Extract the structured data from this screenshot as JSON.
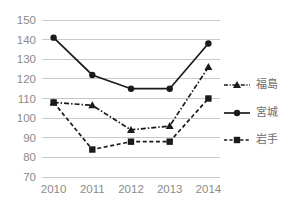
{
  "chart_data": {
    "type": "line",
    "title": "",
    "xlabel": "",
    "ylabel": "",
    "categories": [
      "2010",
      "2011",
      "2012",
      "2013",
      "2014"
    ],
    "x": [
      2010,
      2011,
      2012,
      2013,
      2014
    ],
    "ylim": [
      70,
      150
    ],
    "y_ticks": [
      70,
      80,
      90,
      100,
      110,
      120,
      130,
      140,
      150
    ],
    "grid": true,
    "legend_position": "right",
    "series": [
      {
        "name": "福島",
        "marker": "triangle",
        "line_style": "dash-dot",
        "color": "#1a1a1a",
        "values": [
          108,
          106.5,
          94,
          96,
          126
        ]
      },
      {
        "name": "宮城",
        "marker": "circle",
        "line_style": "solid",
        "color": "#1a1a1a",
        "values": [
          141,
          122,
          115,
          115,
          138
        ]
      },
      {
        "name": "岩手",
        "marker": "square",
        "line_style": "dashed",
        "color": "#1a1a1a",
        "values": [
          108,
          84,
          88,
          88,
          110
        ]
      }
    ]
  },
  "axis": {
    "y_tick_labels": [
      "150",
      "140",
      "130",
      "120",
      "110",
      "100",
      "90",
      "80",
      "70"
    ],
    "x_tick_labels": [
      "2010",
      "2011",
      "2012",
      "2013",
      "2014"
    ]
  },
  "legend": {
    "items": [
      {
        "label": "福島"
      },
      {
        "label": "宮城"
      },
      {
        "label": "岩手"
      }
    ]
  },
  "colors": {
    "gridline": "#c9c9c9",
    "tick_text": "#8b8b8b",
    "legend_text": "#6e6e6e",
    "series": "#1a1a1a",
    "background": "#ffffff"
  }
}
